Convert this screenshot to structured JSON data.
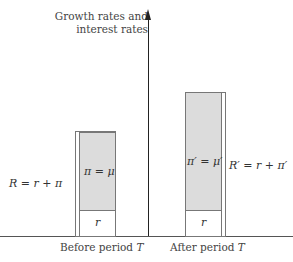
{
  "axis": {
    "y_title_line1": "Growth rates and",
    "y_title_line2": "interest rates"
  },
  "bars": [
    {
      "category": "Before period",
      "category_var": "T",
      "top_label": "π = μ",
      "bottom_label": "r",
      "bracket_label": "R = r + π"
    },
    {
      "category": "After period",
      "category_var": "T",
      "top_label": "π′ = μ′",
      "bottom_label": "r",
      "bracket_label": "R′ = r + π′"
    }
  ],
  "colors": {
    "inflation_fill": "#dcdcdc",
    "real_rate_fill": "#ffffff",
    "lines": "#777777"
  }
}
